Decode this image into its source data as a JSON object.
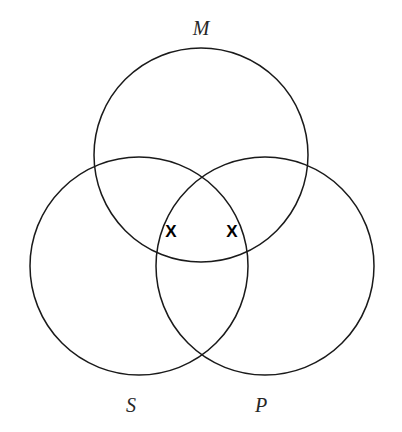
{
  "figure": {
    "background_color": "#ffffff",
    "stroke_color": "#1a1a1a",
    "label_color": "#262626",
    "mark_color": "#000000",
    "stroke_width": 1.5,
    "width": 402,
    "height": 432
  },
  "circles": [
    {
      "id": "M",
      "label": "M",
      "cx": 201,
      "cy": 155,
      "r": 107,
      "label_x": 201,
      "label_y": 30
    },
    {
      "id": "S",
      "label": "S",
      "cx": 139,
      "cy": 266,
      "r": 109,
      "label_x": 131,
      "label_y": 407
    },
    {
      "id": "P",
      "label": "P",
      "cx": 265,
      "cy": 266,
      "r": 109,
      "label_x": 261,
      "label_y": 407
    }
  ],
  "marks": [
    {
      "id": "x-left",
      "glyph": "X",
      "x": 171,
      "y": 233,
      "region": "S and M, outside P"
    },
    {
      "id": "x-right",
      "glyph": "X",
      "x": 232,
      "y": 233,
      "region": "M and P, outside S"
    }
  ]
}
